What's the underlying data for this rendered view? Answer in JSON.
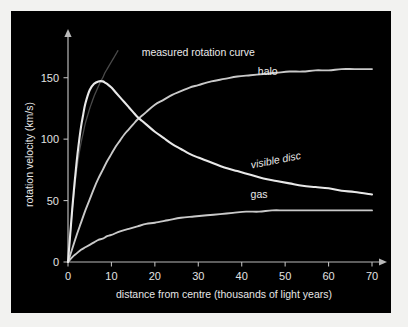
{
  "figure": {
    "background_color": "#f2f2f0",
    "panel_color": "#000000",
    "line_color": "#e8e8e8"
  },
  "chart_data": {
    "type": "line",
    "title": "",
    "xlabel": "distance from centre (thousands of light years)",
    "ylabel": "rotation velocity (km/s)",
    "xlim": [
      0,
      70
    ],
    "ylim": [
      0,
      175
    ],
    "xticks": [
      "0",
      "10",
      "20",
      "30",
      "40",
      "50",
      "60",
      "70"
    ],
    "xtick_values": [
      0,
      10,
      20,
      30,
      40,
      50,
      60,
      70
    ],
    "yticks": [
      "0",
      "50",
      "100",
      "150"
    ],
    "ytick_values": [
      0,
      50,
      100,
      150
    ],
    "grid": false,
    "legend_position": "inline-annotations",
    "annotations": [
      {
        "text": "measured rotation curve",
        "x": 30,
        "y": 168,
        "style": "plain"
      },
      {
        "text": "halo",
        "x": 46,
        "y": 152,
        "style": "plain"
      },
      {
        "text": "visible disc",
        "x": 48,
        "y": 80,
        "style": "italic"
      },
      {
        "text": "gas",
        "x": 44,
        "y": 52,
        "style": "plain"
      }
    ],
    "series": [
      {
        "name": "measured rotation curve",
        "style": "faint",
        "x": [
          0,
          0.5,
          1,
          1.5,
          2,
          2.5,
          3,
          3.5,
          4,
          4.5,
          5,
          5.5,
          6,
          6.5,
          7,
          7.5,
          8,
          8.5,
          9,
          9.5,
          10,
          10.5,
          11,
          11.5
        ],
        "values": [
          0,
          22,
          43,
          60,
          75,
          87,
          97,
          105,
          113,
          119,
          125,
          130,
          135,
          139,
          143,
          147,
          150,
          154,
          157,
          160,
          163,
          166,
          169,
          172
        ]
      },
      {
        "name": "visible disc",
        "style": "bright",
        "x": [
          0,
          0.5,
          1,
          1.5,
          2,
          2.5,
          3,
          3.5,
          4,
          5,
          6,
          7,
          8,
          8.5,
          9,
          10,
          11,
          12,
          13,
          14,
          15,
          16,
          17,
          18,
          20,
          22,
          24,
          26,
          28,
          30,
          33,
          36,
          39,
          42,
          45,
          48,
          51,
          54,
          57,
          60,
          63,
          66,
          70
        ],
        "values": [
          0,
          22,
          44,
          64,
          82,
          97,
          110,
          120,
          129,
          140,
          145,
          147,
          147,
          146,
          145,
          142,
          138,
          134,
          130,
          126,
          122,
          118,
          115,
          112,
          106,
          101,
          96,
          92,
          88,
          85,
          81,
          77,
          74,
          71,
          68,
          66,
          64,
          62,
          61,
          60,
          58,
          57,
          55
        ]
      },
      {
        "name": "halo",
        "style": "mid",
        "x": [
          0,
          1,
          2,
          3,
          4,
          5,
          6,
          7,
          8,
          9,
          10,
          11,
          12,
          13,
          14,
          15,
          16,
          17,
          18,
          20,
          22,
          24,
          26,
          28,
          30,
          33,
          36,
          39,
          42,
          45,
          48,
          51,
          54,
          57,
          60,
          63,
          66,
          70
        ],
        "values": [
          0,
          11,
          22,
          32,
          42,
          51,
          60,
          68,
          75,
          82,
          88,
          94,
          99,
          104,
          108,
          112,
          116,
          119,
          122,
          128,
          132,
          136,
          139,
          142,
          144,
          147,
          149,
          151,
          152,
          153,
          154,
          155,
          155,
          156,
          156,
          157,
          157,
          157
        ]
      },
      {
        "name": "gas",
        "style": "mid",
        "x": [
          0,
          1,
          2,
          3,
          4,
          5,
          6,
          7,
          8,
          9,
          10,
          12,
          14,
          16,
          18,
          20,
          23,
          26,
          29,
          32,
          35,
          38,
          41,
          44,
          47,
          50,
          55,
          60,
          65,
          70
        ],
        "values": [
          0,
          4,
          7,
          10,
          12,
          14,
          16,
          18,
          19,
          21,
          22,
          25,
          27,
          29,
          31,
          32,
          34,
          36,
          37,
          38,
          39,
          40,
          41,
          41,
          42,
          42,
          42,
          42,
          42,
          42
        ]
      }
    ]
  }
}
